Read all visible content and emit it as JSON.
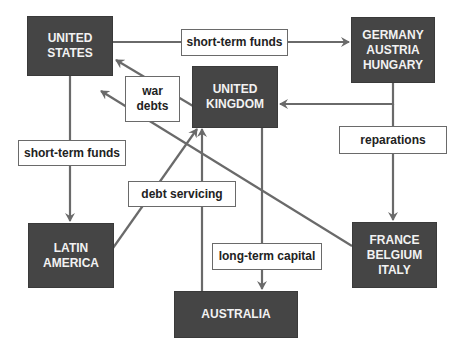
{
  "diagram": {
    "type": "flow",
    "colors": {
      "node_fill": "#454545",
      "node_text": "#f2f2f2",
      "arrow": "#6a6a6a",
      "label_border": "#6a6a6a",
      "label_text": "#222222"
    },
    "nodes": {
      "united_states": {
        "line1": "UNITED",
        "line2": "STATES"
      },
      "germany": {
        "line1": "GERMANY",
        "line2": "AUSTRIA",
        "line3": "HUNGARY"
      },
      "united_kingdom": {
        "line1": "UNITED",
        "line2": "KINGDOM"
      },
      "latin_america": {
        "line1": "LATIN",
        "line2": "AMERICA"
      },
      "france": {
        "line1": "FRANCE",
        "line2": "BELGIUM",
        "line3": "ITALY"
      },
      "australia": {
        "line1": "AUSTRALIA"
      }
    },
    "labels": {
      "us_to_germany": "short-term funds",
      "war_debts": {
        "line1": "war",
        "line2": "debts"
      },
      "us_to_latin": "short-term funds",
      "debt_servicing": "debt servicing",
      "reparations": "reparations",
      "long_term_capital": "long-term capital"
    },
    "edges": [
      {
        "from": "UNITED STATES",
        "to": "GERMANY AUSTRIA HUNGARY",
        "label": "short-term funds"
      },
      {
        "from": "GERMANY AUSTRIA HUNGARY",
        "to": "UNITED KINGDOM",
        "label": ""
      },
      {
        "from": "GERMANY AUSTRIA HUNGARY",
        "to": "FRANCE BELGIUM ITALY",
        "label": "reparations"
      },
      {
        "from": "UNITED KINGDOM",
        "to": "UNITED STATES",
        "label": "war debts"
      },
      {
        "from": "FRANCE BELGIUM ITALY",
        "to": "UNITED STATES",
        "label": "war debts"
      },
      {
        "from": "UNITED STATES",
        "to": "LATIN AMERICA",
        "label": "short-term funds"
      },
      {
        "from": "LATIN AMERICA",
        "to": "UNITED KINGDOM",
        "label": "debt servicing"
      },
      {
        "from": "AUSTRALIA",
        "to": "UNITED KINGDOM",
        "label": "debt servicing"
      },
      {
        "from": "UNITED KINGDOM",
        "to": "AUSTRALIA",
        "label": "long-term capital"
      }
    ]
  }
}
